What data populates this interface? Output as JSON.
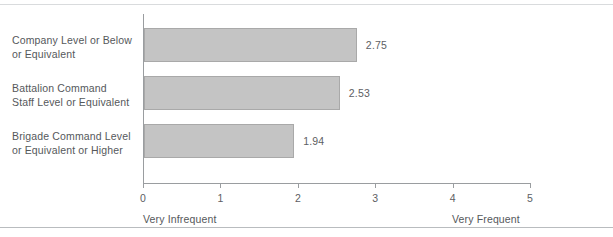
{
  "chart_data": {
    "type": "bar",
    "orientation": "horizontal",
    "title": "",
    "subtitle": "",
    "xlabel": "",
    "ylabel": "",
    "categories": [
      "Company Level or Below or Equivalent",
      "Battalion Command Staff Level or Equivalent",
      "Brigade Command Level or Equivalent or Higher"
    ],
    "values": [
      2.75,
      2.53,
      1.94
    ],
    "value_labels": [
      "2.75",
      "2.53",
      "1.94"
    ],
    "xlim": [
      0,
      5
    ],
    "xticks": [
      0,
      1,
      2,
      3,
      4,
      5
    ],
    "xtick_labels": [
      "0",
      "1",
      "2",
      "3",
      "4",
      "5"
    ],
    "grid": false,
    "legend": "none",
    "scale_anchor_low": "Very Infrequent",
    "scale_anchor_high": "Very Frequent",
    "bar_color": "#c4c4c4",
    "bar_border_color": "#a9a9a9",
    "axis_color": "#9a9da0",
    "text_color": "#55585b"
  },
  "labels": {
    "cat0_line1": "Company Level or Below",
    "cat0_line2": "or Equivalent",
    "cat1_line1": "Battalion Command",
    "cat1_line2": "Staff Level or Equivalent",
    "cat2_line1": "Brigade Command Level",
    "cat2_line2": "or Equivalent or Higher"
  }
}
